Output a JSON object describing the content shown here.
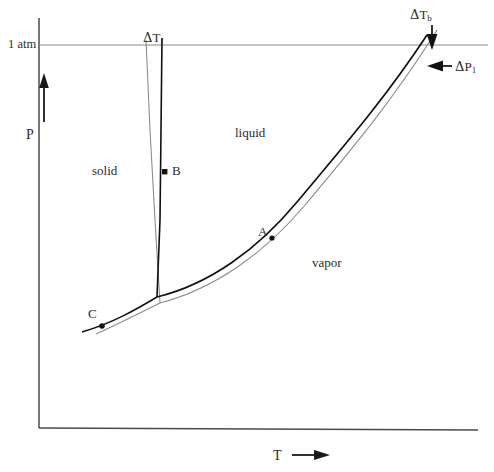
{
  "figure": {
    "type": "phase-diagram"
  },
  "axes": {
    "y": {
      "label": "P",
      "arrow": "up-arrow-icon",
      "reference_line_label": "1 atm",
      "reference_line_y": 45,
      "axis_x": 39,
      "axis_top_y": 18,
      "axis_bottom_y": 428
    },
    "x": {
      "label": "T",
      "arrow": "right-arrow-icon",
      "axis_y": 428,
      "axis_left_x": 39,
      "axis_right_x": 478
    }
  },
  "regions": [
    {
      "name": "solid",
      "label": "solid",
      "x": 92,
      "y": 164
    },
    {
      "name": "liquid",
      "label": "liquid",
      "x": 235,
      "y": 126
    },
    {
      "name": "vapor",
      "label": "vapor",
      "x": 312,
      "y": 256
    }
  ],
  "points": [
    {
      "name": "A",
      "label": "A",
      "marker_x": 272,
      "marker_y": 238,
      "label_x": 258,
      "label_y": 225
    },
    {
      "name": "B",
      "label": "B",
      "marker_x": 165,
      "marker_y": 172,
      "label_x": 172,
      "label_y": 164
    },
    {
      "name": "C",
      "label": "C",
      "marker_x": 102,
      "marker_y": 326,
      "label_x": 88,
      "label_y": 307
    }
  ],
  "annotations": [
    {
      "name": "delta-Tf",
      "text_delta": "Δ",
      "text_symbol": "T",
      "text_sub": "f",
      "label_x": 143,
      "label_y": 31,
      "meaning": "freezing point depression"
    },
    {
      "name": "delta-Tb",
      "text_delta": "Δ",
      "text_symbol": "T",
      "text_sub": "b",
      "label_x": 410,
      "label_y": 8,
      "meaning": "boiling point elevation",
      "arrow": "down-arrow-icon"
    },
    {
      "name": "delta-P1",
      "text_delta": "Δ",
      "text_symbol": "P",
      "text_sub": "1",
      "label_x": 455,
      "label_y": 60,
      "meaning": "vapor pressure lowering",
      "arrow": "left-arrow-icon"
    }
  ],
  "curves": {
    "solvent": {
      "name": "pure-solvent",
      "color": "#111111",
      "stroke_width": 1.6,
      "triple_point": {
        "x": 157,
        "y": 297
      },
      "fusion_top": {
        "x": 162,
        "y": 38
      },
      "sublimation_start": {
        "x": 82,
        "y": 332
      },
      "vaporization_top": {
        "x": 427,
        "y": 35
      }
    },
    "solution": {
      "name": "solution",
      "color": "#8c8c8c",
      "stroke_width": 1.1,
      "triple_point": {
        "x": 160,
        "y": 303
      },
      "fusion_top": {
        "x": 146,
        "y": 40
      },
      "vaporization_top": {
        "x": 437,
        "y": 30
      }
    }
  },
  "colors": {
    "background": "#ffffff",
    "solvent_line": "#111111",
    "solution_line": "#8c8c8c",
    "axis": "#4a4a4a",
    "reference_line": "#8a8a8a",
    "text": "#2b2b2b"
  }
}
